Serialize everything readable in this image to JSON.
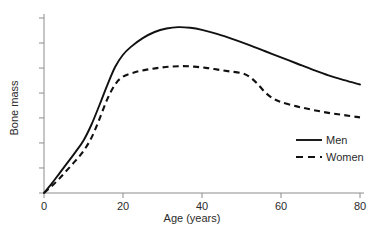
{
  "chart_data": {
    "type": "line",
    "title": "",
    "subtitle": "",
    "xlabel": "Age (years)",
    "ylabel": "Bone mass",
    "xlim": [
      0,
      80
    ],
    "ylim": [
      0,
      1
    ],
    "xticks": [
      0,
      20,
      40,
      60,
      80
    ],
    "xticklabels": [
      "0",
      "20",
      "40",
      "60",
      "80"
    ],
    "yticks": [
      0,
      0.143,
      0.286,
      0.429,
      0.571,
      0.714,
      0.857,
      1.0
    ],
    "yticklabels": [
      "",
      "",
      "",
      "",
      "",
      "",
      "",
      ""
    ],
    "grid": false,
    "legend_position": "center right",
    "series": [
      {
        "name": "Men",
        "style": "solid",
        "color": "#111111",
        "x": [
          0,
          2,
          4,
          6,
          8,
          10,
          12,
          14,
          16,
          18,
          20,
          22,
          25,
          28,
          31,
          34,
          37,
          40,
          44,
          48,
          52,
          56,
          60,
          64,
          68,
          72,
          76,
          80
        ],
        "y": [
          0.0,
          0.055,
          0.115,
          0.175,
          0.235,
          0.3,
          0.39,
          0.5,
          0.615,
          0.72,
          0.79,
          0.835,
          0.885,
          0.92,
          0.94,
          0.948,
          0.944,
          0.932,
          0.908,
          0.878,
          0.845,
          0.81,
          0.775,
          0.74,
          0.705,
          0.672,
          0.645,
          0.62
        ]
      },
      {
        "name": "Women",
        "style": "dashed",
        "color": "#111111",
        "x": [
          0,
          2,
          4,
          6,
          8,
          10,
          12,
          14,
          16,
          18,
          20,
          23,
          26,
          29,
          32,
          35,
          38,
          41,
          44,
          47,
          50,
          52,
          54,
          56,
          58,
          60,
          64,
          68,
          72,
          76,
          80
        ],
        "y": [
          0.0,
          0.04,
          0.085,
          0.135,
          0.185,
          0.24,
          0.315,
          0.42,
          0.535,
          0.62,
          0.665,
          0.69,
          0.705,
          0.715,
          0.722,
          0.725,
          0.722,
          0.715,
          0.705,
          0.695,
          0.685,
          0.665,
          0.625,
          0.575,
          0.54,
          0.52,
          0.495,
          0.475,
          0.458,
          0.445,
          0.432
        ]
      }
    ],
    "annotations": []
  },
  "legend": {
    "items": [
      {
        "label": "Men",
        "style": "solid"
      },
      {
        "label": "Women",
        "style": "dashed"
      }
    ]
  }
}
